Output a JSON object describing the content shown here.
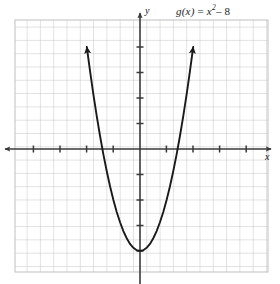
{
  "figure": {
    "width": 280,
    "height": 284,
    "background": "#ffffff"
  },
  "labels": {
    "function_label_full": "g(x) = x2 – 8",
    "function_name": "g(x)",
    "equals": "=",
    "variable": "x",
    "exponent": "2",
    "minus_constant": "– 8",
    "x_axis_name": "x",
    "y_axis_name": "y"
  },
  "colors": {
    "grid": "#b9b9b9",
    "grid_minor": "#cfcfcf",
    "axis": "#3a3a3a",
    "curve": "#1a1a1a",
    "text": "#1a1a1a",
    "background": "#ffffff"
  },
  "chart_data": {
    "type": "line",
    "subtitle": "",
    "xlabel": "x",
    "ylabel": "y",
    "equation": "g(x) = x^2 - 8",
    "function_form": "quadratic",
    "grid": true,
    "grid_step_x": 1,
    "grid_step_y": 1,
    "tick_step_x": 2,
    "tick_step_y": 2,
    "tick_labels_shown": false,
    "legend": "none",
    "xlim": [
      -9.4,
      9.6
    ],
    "ylim": [
      -10.1,
      10.1
    ],
    "vertex": [
      0,
      -8
    ],
    "x_intercepts": [
      -2.83,
      2.83
    ],
    "y_intercept": -8,
    "axis_of_symmetry": 0,
    "domain_drawn": [
      -4.0,
      4.0
    ],
    "arrowheads": [
      "curve-left-end",
      "curve-right-end",
      "x-axis-left",
      "x-axis-right",
      "y-axis-top"
    ],
    "series": [
      {
        "name": "g(x) = x2 – 8",
        "x": [
          -4.0,
          -3.75,
          -3.5,
          -3.25,
          -3.0,
          -2.75,
          -2.5,
          -2.25,
          -2.0,
          -1.75,
          -1.5,
          -1.25,
          -1.0,
          -0.75,
          -0.5,
          -0.25,
          0.0,
          0.25,
          0.5,
          0.75,
          1.0,
          1.25,
          1.5,
          1.75,
          2.0,
          2.25,
          2.5,
          2.75,
          3.0,
          3.25,
          3.5,
          3.75,
          4.0
        ],
        "y": [
          8.0,
          6.06,
          4.25,
          2.56,
          1.0,
          -0.44,
          -1.75,
          -2.94,
          -4.0,
          -4.94,
          -5.75,
          -6.44,
          -7.0,
          -7.44,
          -7.75,
          -7.94,
          -8.0,
          -7.94,
          -7.75,
          -7.44,
          -7.0,
          -6.44,
          -5.75,
          -4.94,
          -4.0,
          -2.94,
          -1.75,
          -0.44,
          1.0,
          2.56,
          4.25,
          6.06,
          8.0
        ]
      }
    ]
  },
  "geometry": {
    "grid_left": 15,
    "grid_right": 268,
    "grid_top": 20,
    "grid_bottom": 272,
    "cell": 13.3,
    "origin_x": 140,
    "origin_y": 149,
    "unit_x": 13.3,
    "unit_y": 12.75
  }
}
